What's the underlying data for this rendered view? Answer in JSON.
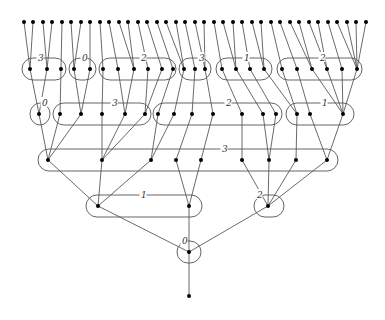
{
  "diagram": {
    "width": 385,
    "height": 320,
    "levels_y": [
      22,
      69,
      114,
      160,
      206,
      252,
      296
    ],
    "leaves_x": [
      24,
      33,
      43,
      52,
      62,
      71,
      81,
      90,
      100,
      109,
      119,
      128,
      138,
      147,
      157,
      166,
      176,
      185,
      195,
      204,
      214,
      223,
      233,
      242,
      252,
      261,
      271,
      280,
      290,
      299,
      309,
      318,
      328,
      337,
      347,
      356,
      366
    ],
    "level1": {
      "nodes": [
        {
          "x": 30,
          "children": [
            0,
            1
          ]
        },
        {
          "x": 47,
          "children": [
            2,
            3
          ]
        },
        {
          "x": 61,
          "children": [
            4
          ]
        },
        {
          "x": 74,
          "children": [
            5,
            6
          ]
        },
        {
          "x": 90,
          "children": [
            7
          ]
        },
        {
          "x": 103,
          "children": [
            8
          ]
        },
        {
          "x": 118,
          "children": [
            9
          ]
        },
        {
          "x": 134,
          "children": [
            10,
            11
          ]
        },
        {
          "x": 148,
          "children": [
            12
          ]
        },
        {
          "x": 162,
          "children": [
            13
          ]
        },
        {
          "x": 173,
          "children": [
            14
          ]
        },
        {
          "x": 184,
          "children": [
            15,
            16
          ]
        },
        {
          "x": 195,
          "children": [
            17
          ]
        },
        {
          "x": 205,
          "children": [
            18,
            19
          ]
        },
        {
          "x": 222,
          "children": [
            20
          ]
        },
        {
          "x": 236,
          "children": [
            21,
            22
          ]
        },
        {
          "x": 250,
          "children": [
            23
          ]
        },
        {
          "x": 264,
          "children": [
            24,
            25
          ]
        },
        {
          "x": 282,
          "children": [
            26
          ]
        },
        {
          "x": 297,
          "children": [
            27
          ]
        },
        {
          "x": 312,
          "children": [
            28,
            29
          ]
        },
        {
          "x": 327,
          "children": [
            30,
            31
          ]
        },
        {
          "x": 342,
          "children": [
            32
          ]
        },
        {
          "x": 357,
          "children": [
            33,
            34,
            35,
            36
          ]
        }
      ],
      "groups": [
        {
          "x1": 22,
          "x2": 66,
          "label": "3",
          "lx": 38
        },
        {
          "x1": 69,
          "x2": 96,
          "label": "0",
          "lx": 82
        },
        {
          "x1": 99,
          "x2": 176,
          "label": "2",
          "lx": 141
        },
        {
          "x1": 179,
          "x2": 211,
          "label": "3",
          "lx": 199
        },
        {
          "x1": 216,
          "x2": 272,
          "label": "1",
          "lx": 244
        },
        {
          "x1": 277,
          "x2": 362,
          "label": "2",
          "lx": 320
        }
      ]
    },
    "level2": {
      "nodes": [
        {
          "x": 39,
          "children": [
            0,
            1
          ]
        },
        {
          "x": 60,
          "children": [
            2
          ]
        },
        {
          "x": 81,
          "children": [
            3,
            4
          ]
        },
        {
          "x": 102,
          "children": [
            5
          ]
        },
        {
          "x": 125,
          "children": [
            6,
            7
          ]
        },
        {
          "x": 145,
          "children": [
            8,
            9
          ]
        },
        {
          "x": 158,
          "children": [
            10
          ]
        },
        {
          "x": 174,
          "children": [
            11
          ]
        },
        {
          "x": 192,
          "children": [
            12
          ]
        },
        {
          "x": 213,
          "children": [
            13
          ]
        },
        {
          "x": 242,
          "children": [
            14
          ]
        },
        {
          "x": 263,
          "children": [
            15
          ]
        },
        {
          "x": 276,
          "children": [
            16
          ]
        },
        {
          "x": 297,
          "children": [
            17,
            18
          ]
        },
        {
          "x": 310,
          "children": [
            19
          ]
        },
        {
          "x": 343,
          "children": [
            20,
            21,
            22,
            23
          ]
        }
      ],
      "groups": [
        {
          "x1": 30,
          "x2": 50,
          "label": "0",
          "lx": 42
        },
        {
          "x1": 53,
          "x2": 151,
          "label": "3",
          "lx": 112
        },
        {
          "x1": 153,
          "x2": 282,
          "label": "2",
          "lx": 226
        },
        {
          "x1": 286,
          "x2": 354,
          "label": "1",
          "lx": 322
        }
      ]
    },
    "level3": {
      "nodes": [
        {
          "x": 48,
          "children": [
            0,
            1,
            2
          ]
        },
        {
          "x": 102,
          "children": [
            3,
            4,
            5
          ]
        },
        {
          "x": 151,
          "children": [
            6,
            7
          ]
        },
        {
          "x": 176,
          "children": [
            8
          ]
        },
        {
          "x": 201,
          "children": [
            9
          ]
        },
        {
          "x": 242,
          "children": [
            10
          ]
        },
        {
          "x": 269,
          "children": [
            11,
            12
          ]
        },
        {
          "x": 296,
          "children": [
            13
          ]
        },
        {
          "x": 327,
          "children": [
            14,
            15
          ]
        }
      ],
      "groups": [
        {
          "x1": 38,
          "x2": 338,
          "label": "3",
          "lx": 222
        }
      ]
    },
    "level4": {
      "nodes": [
        {
          "x": 98,
          "children": [
            0,
            1,
            2
          ]
        },
        {
          "x": 189,
          "children": [
            3,
            4
          ]
        },
        {
          "x": 268,
          "children": [
            5,
            6,
            7,
            8
          ]
        }
      ],
      "groups": [
        {
          "x1": 86,
          "x2": 202,
          "label": "1",
          "lx": 141
        },
        {
          "x1": 254,
          "x2": 284,
          "label": "2",
          "lx": 257
        }
      ]
    },
    "level5": {
      "nodes": [
        {
          "x": 189,
          "children": [
            0,
            1,
            2
          ]
        }
      ],
      "groups": [
        {
          "x1": 177,
          "x2": 201,
          "label": "0",
          "lx": 182
        }
      ]
    },
    "tail": {
      "x": 189,
      "y_from": 252,
      "y_to": 296
    }
  }
}
